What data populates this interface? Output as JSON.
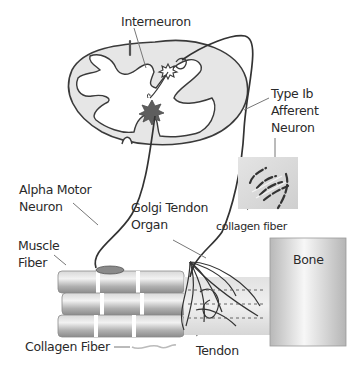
{
  "diagram": {
    "type": "anatomy",
    "labels": {
      "interneuron": "Interneuron",
      "type_ib_line1": "Type Ib",
      "type_ib_line2": "Afferent",
      "type_ib_line3": "Neuron",
      "alpha_line1": "Alpha Motor",
      "alpha_line2": "Neuron",
      "golgi_line1": "Golgi Tendon",
      "golgi_line2": "Organ",
      "muscle_line1": "Muscle",
      "muscle_line2": "Fiber",
      "collagen_inset": "collagen fiber",
      "bone": "Bone",
      "collagen_main": "Collagen Fiber",
      "tendon": "Tendon"
    },
    "colors": {
      "outline": "#3a3a3a",
      "cord_fill": "#e6e6e6",
      "grey_matter": "#ffffff",
      "neuron_body": "#6a6a6a",
      "muscle": "#b5b5b5",
      "bone_light": "#f4f4f4",
      "bone_dark": "#b9b9b9"
    }
  }
}
